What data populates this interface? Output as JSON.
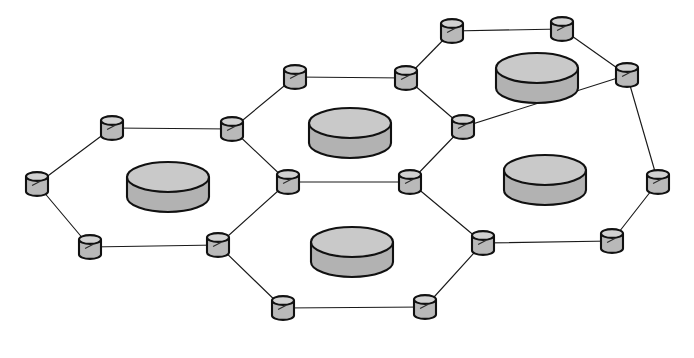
{
  "figure": {
    "title": "Hexagonal clustered sensor network topology",
    "background_color": "#ffffff",
    "width": 694,
    "height": 358,
    "outline_color": "#111111",
    "link_color": "#1a1a1a"
  },
  "legend_semantics": {
    "sensor_node": "small cylinder (hexagon vertex)",
    "cluster_head": "large flat disk (hexagon center)"
  },
  "style": {
    "sensor_node": {
      "radius_x": 11,
      "body_height": 15,
      "ellipse_ry": 4.4,
      "top_fill": "#d2d2d2",
      "body_fill": "#b9b9b9",
      "stroke": "#111111",
      "stroke_width": 2.1
    },
    "cluster_head": {
      "radius_x": 41,
      "body_height": 20,
      "ellipse_ry": 15,
      "top_fill": "#c9c9c9",
      "body_fill": "#b2b2b2",
      "stroke": "#111111",
      "stroke_width": 2.4
    },
    "link": {
      "color": "#1a1a1a",
      "width": 1.15
    }
  },
  "chart_data": {
    "type": "diagram",
    "subtype": "hexagonal-cluster-graph",
    "title": "Hexagonal clustered sensor network topology",
    "xlabel": "",
    "ylabel": "",
    "xlim": [
      0,
      694
    ],
    "ylim": [
      0,
      358
    ],
    "grid": false,
    "legend": "none",
    "clusters": [
      {
        "id": "cluster-left",
        "label": "Cluster 1",
        "head": {
          "id": "head-left",
          "x": 168,
          "y": 187
        },
        "vertex_ids": [
          "n-w",
          "n-nw",
          "n-n1",
          "n-c1",
          "n-s1",
          "n-sw"
        ]
      },
      {
        "id": "cluster-top",
        "label": "Cluster 2",
        "head": {
          "id": "head-top",
          "x": 350,
          "y": 133
        },
        "vertex_ids": [
          "n-n1",
          "n-t1",
          "n-t2",
          "n-t3",
          "n-c2",
          "n-c1"
        ]
      },
      {
        "id": "cluster-bottom",
        "label": "Cluster 3",
        "head": {
          "id": "head-bottom",
          "x": 352,
          "y": 252
        },
        "vertex_ids": [
          "n-c1",
          "n-c2",
          "n-b2",
          "n-b3",
          "n-b1",
          "n-s1"
        ]
      },
      {
        "id": "cluster-right",
        "label": "Cluster 4",
        "head": {
          "id": "head-right",
          "x": 545,
          "y": 180
        },
        "vertex_ids": [
          "n-c2",
          "n-t3",
          "n-r1",
          "n-r2",
          "n-b4",
          "n-b2"
        ]
      },
      {
        "id": "cluster-topright",
        "label": "Cluster 5",
        "head": {
          "id": "head-topright",
          "x": 537,
          "y": 78
        },
        "vertex_ids": [
          "n-t1",
          "n-t2",
          "n-tr1",
          "n-tr2",
          "n-r1",
          "n-t3"
        ]
      }
    ],
    "nodes": [
      {
        "id": "n-w",
        "label": "N1",
        "x": 37,
        "y": 184,
        "type": "sensor_node"
      },
      {
        "id": "n-nw",
        "label": "N2",
        "x": 112,
        "y": 128,
        "type": "sensor_node"
      },
      {
        "id": "n-sw",
        "label": "N3",
        "x": 90,
        "y": 247,
        "type": "sensor_node"
      },
      {
        "id": "n-n1",
        "label": "N4",
        "x": 232,
        "y": 129,
        "type": "sensor_node"
      },
      {
        "id": "n-s1",
        "label": "N5",
        "x": 218,
        "y": 245,
        "type": "sensor_node"
      },
      {
        "id": "n-c1",
        "label": "N6",
        "x": 288,
        "y": 182,
        "type": "sensor_node"
      },
      {
        "id": "n-t1",
        "label": "N7",
        "x": 295,
        "y": 77,
        "type": "sensor_node"
      },
      {
        "id": "n-t2",
        "label": "N8",
        "x": 406,
        "y": 78,
        "type": "sensor_node"
      },
      {
        "id": "n-t3",
        "label": "N9",
        "x": 463,
        "y": 127,
        "type": "sensor_node"
      },
      {
        "id": "n-c2",
        "label": "N10",
        "x": 410,
        "y": 182,
        "type": "sensor_node"
      },
      {
        "id": "n-tr1",
        "label": "N11",
        "x": 452,
        "y": 31,
        "type": "sensor_node"
      },
      {
        "id": "n-tr2",
        "label": "N12",
        "x": 562,
        "y": 29,
        "type": "sensor_node"
      },
      {
        "id": "n-r1",
        "label": "N13",
        "x": 627,
        "y": 75,
        "type": "sensor_node"
      },
      {
        "id": "n-r2",
        "label": "N14",
        "x": 658,
        "y": 182,
        "type": "sensor_node"
      },
      {
        "id": "n-b1",
        "label": "N15",
        "x": 283,
        "y": 308,
        "type": "sensor_node"
      },
      {
        "id": "n-b3",
        "label": "N16",
        "x": 425,
        "y": 307,
        "type": "sensor_node"
      },
      {
        "id": "n-b2",
        "label": "N17",
        "x": 483,
        "y": 243,
        "type": "sensor_node"
      },
      {
        "id": "n-b4",
        "label": "N18",
        "x": 612,
        "y": 241,
        "type": "sensor_node"
      }
    ],
    "cluster_heads": [
      {
        "id": "head-left",
        "label": "CH1",
        "x": 168,
        "y": 187,
        "type": "cluster_head"
      },
      {
        "id": "head-top",
        "label": "CH2",
        "x": 350,
        "y": 133,
        "type": "cluster_head"
      },
      {
        "id": "head-bottom",
        "label": "CH3",
        "x": 352,
        "y": 252,
        "type": "cluster_head"
      },
      {
        "id": "head-right",
        "label": "CH4",
        "x": 545,
        "y": 180,
        "type": "cluster_head"
      },
      {
        "id": "head-topright",
        "label": "CH5",
        "x": 537,
        "y": 78,
        "type": "cluster_head"
      }
    ],
    "links": [
      {
        "source": "n-w",
        "target": "n-nw"
      },
      {
        "source": "n-w",
        "target": "n-sw"
      },
      {
        "source": "n-nw",
        "target": "n-n1"
      },
      {
        "source": "n-sw",
        "target": "n-s1"
      },
      {
        "source": "n-n1",
        "target": "n-c1"
      },
      {
        "source": "n-s1",
        "target": "n-c1"
      },
      {
        "source": "n-n1",
        "target": "n-t1"
      },
      {
        "source": "n-t1",
        "target": "n-t2"
      },
      {
        "source": "n-t2",
        "target": "n-t3"
      },
      {
        "source": "n-t3",
        "target": "n-c2"
      },
      {
        "source": "n-c1",
        "target": "n-c2"
      },
      {
        "source": "n-t2",
        "target": "n-tr1"
      },
      {
        "source": "n-tr1",
        "target": "n-tr2"
      },
      {
        "source": "n-tr2",
        "target": "n-r1"
      },
      {
        "source": "n-r1",
        "target": "n-t3"
      },
      {
        "source": "n-r1",
        "target": "n-r2"
      },
      {
        "source": "n-r2",
        "target": "n-b4"
      },
      {
        "source": "n-b4",
        "target": "n-b2"
      },
      {
        "source": "n-b2",
        "target": "n-c2"
      },
      {
        "source": "n-b2",
        "target": "n-b3"
      },
      {
        "source": "n-b3",
        "target": "n-b1"
      },
      {
        "source": "n-b1",
        "target": "n-s1"
      }
    ],
    "counts": {
      "sensor_nodes": 18,
      "cluster_heads": 5,
      "links": 22,
      "hexagonal_cells": 5
    }
  }
}
